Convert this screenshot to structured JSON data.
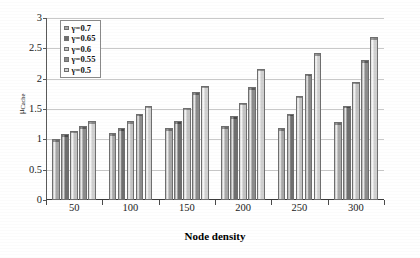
{
  "chart_data": {
    "type": "bar",
    "title": "",
    "xlabel": "Node density",
    "ylabel": "μCache",
    "ylabel_base": "μ",
    "ylabel_sub": "Cache",
    "categories": [
      "50",
      "100",
      "150",
      "200",
      "250",
      "300"
    ],
    "ylim": [
      0,
      3
    ],
    "yticks": [
      "0",
      "0.5",
      "1",
      "1.5",
      "2",
      "2.5",
      "3"
    ],
    "ytick_values": [
      0,
      0.5,
      1,
      1.5,
      2,
      2.5,
      3
    ],
    "grid": true,
    "legend_position": "top-left",
    "series": [
      {
        "name": "γ=0.7",
        "color": "#a8a8a8",
        "values": [
          1.0,
          1.1,
          1.18,
          1.22,
          1.18,
          1.28
        ]
      },
      {
        "name": "γ=0.65",
        "color": "#6f6f6f",
        "values": [
          1.08,
          1.18,
          1.3,
          1.38,
          1.42,
          1.55
        ]
      },
      {
        "name": "γ=0.6",
        "color": "#c3c3c3",
        "values": [
          1.14,
          1.3,
          1.52,
          1.6,
          1.72,
          1.95
        ]
      },
      {
        "name": "γ=0.55",
        "color": "#8c8c8c",
        "values": [
          1.22,
          1.42,
          1.78,
          1.86,
          2.08,
          2.3
        ]
      },
      {
        "name": "γ=0.5",
        "color": "#d0d0d0",
        "values": [
          1.3,
          1.55,
          1.88,
          2.16,
          2.42,
          2.68
        ]
      }
    ]
  }
}
